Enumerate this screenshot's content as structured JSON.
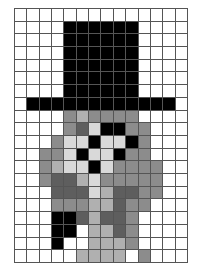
{
  "figure": {
    "grid": {
      "columns": 14,
      "rows": 20,
      "cell_size_px": 12.43,
      "origin_x_px": 14,
      "origin_y_px": 8,
      "width_px": 174,
      "height_px": 255,
      "line_color": "#555555",
      "background_color": "#ffffff"
    },
    "palette": {
      "w": "#ffffff",
      "l": "#d9d9d9",
      "m": "#b0b0b0",
      "g": "#8c8c8c",
      "d": "#5e5e5e",
      "k": "#000000"
    },
    "legend": [
      {
        "key": "w",
        "label": "white",
        "hex": "#ffffff"
      },
      {
        "key": "l",
        "label": "light gray",
        "hex": "#d9d9d9"
      },
      {
        "key": "m",
        "label": "medium light gray",
        "hex": "#b0b0b0"
      },
      {
        "key": "g",
        "label": "medium gray",
        "hex": "#8c8c8c"
      },
      {
        "key": "d",
        "label": "dark gray",
        "hex": "#5e5e5e"
      },
      {
        "key": "k",
        "label": "black",
        "hex": "#000000"
      }
    ],
    "pixels": [
      [
        "w",
        "w",
        "w",
        "w",
        "w",
        "w",
        "w",
        "w",
        "w",
        "w",
        "w",
        "w",
        "w",
        "w"
      ],
      [
        "w",
        "w",
        "w",
        "w",
        "k",
        "k",
        "k",
        "k",
        "k",
        "k",
        "w",
        "w",
        "w",
        "w"
      ],
      [
        "w",
        "w",
        "w",
        "w",
        "k",
        "k",
        "k",
        "k",
        "k",
        "k",
        "w",
        "w",
        "w",
        "w"
      ],
      [
        "w",
        "w",
        "w",
        "w",
        "k",
        "k",
        "k",
        "k",
        "k",
        "k",
        "w",
        "w",
        "w",
        "w"
      ],
      [
        "w",
        "w",
        "w",
        "w",
        "k",
        "k",
        "k",
        "k",
        "k",
        "k",
        "w",
        "w",
        "w",
        "w"
      ],
      [
        "w",
        "w",
        "w",
        "w",
        "k",
        "k",
        "k",
        "k",
        "k",
        "k",
        "w",
        "w",
        "w",
        "w"
      ],
      [
        "w",
        "w",
        "w",
        "w",
        "k",
        "k",
        "k",
        "k",
        "k",
        "k",
        "w",
        "w",
        "w",
        "w"
      ],
      [
        "w",
        "k",
        "k",
        "k",
        "k",
        "k",
        "k",
        "k",
        "k",
        "k",
        "k",
        "k",
        "k",
        "w"
      ],
      [
        "w",
        "w",
        "w",
        "w",
        "g",
        "m",
        "g",
        "g",
        "g",
        "g",
        "w",
        "w",
        "w",
        "w"
      ],
      [
        "w",
        "w",
        "w",
        "w",
        "g",
        "d",
        "l",
        "k",
        "k",
        "g",
        "g",
        "w",
        "w",
        "w"
      ],
      [
        "w",
        "w",
        "w",
        "g",
        "l",
        "l",
        "k",
        "l",
        "l",
        "k",
        "g",
        "w",
        "w",
        "w"
      ],
      [
        "w",
        "w",
        "g",
        "g",
        "l",
        "k",
        "l",
        "l",
        "k",
        "g",
        "g",
        "w",
        "w",
        "w"
      ],
      [
        "w",
        "w",
        "g",
        "m",
        "l",
        "l",
        "k",
        "l",
        "g",
        "g",
        "g",
        "g",
        "w",
        "w"
      ],
      [
        "w",
        "w",
        "g",
        "d",
        "d",
        "m",
        "l",
        "g",
        "g",
        "g",
        "g",
        "g",
        "w",
        "w"
      ],
      [
        "w",
        "w",
        "w",
        "d",
        "d",
        "d",
        "l",
        "m",
        "d",
        "d",
        "g",
        "g",
        "w",
        "w"
      ],
      [
        "w",
        "w",
        "w",
        "g",
        "g",
        "g",
        "m",
        "m",
        "d",
        "g",
        "g",
        "w",
        "w",
        "w"
      ],
      [
        "w",
        "w",
        "w",
        "k",
        "k",
        "d",
        "m",
        "d",
        "d",
        "g",
        "w",
        "w",
        "w",
        "w"
      ],
      [
        "w",
        "w",
        "w",
        "k",
        "k",
        "w",
        "m",
        "m",
        "d",
        "g",
        "w",
        "w",
        "w",
        "w"
      ],
      [
        "w",
        "w",
        "w",
        "k",
        "w",
        "w",
        "m",
        "m",
        "m",
        "g",
        "w",
        "w",
        "w",
        "w"
      ],
      [
        "w",
        "w",
        "w",
        "w",
        "w",
        "m",
        "m",
        "m",
        "m",
        "w",
        "g",
        "w",
        "w",
        "w"
      ]
    ]
  }
}
